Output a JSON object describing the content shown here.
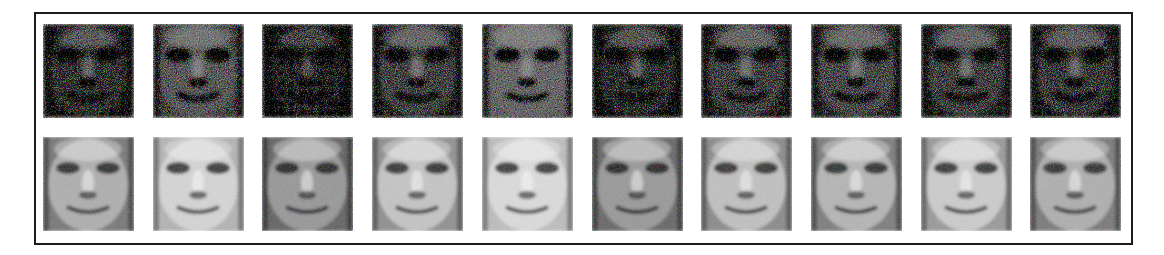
{
  "figure": {
    "frame": {
      "border_color": "#1c1c1c",
      "background": "#ffffff"
    },
    "rows": [
      {
        "label": "noisy",
        "description": "Noisy face images"
      },
      {
        "label": "reconstructed",
        "description": "Denoised / reconstructed face images"
      }
    ],
    "columns": 10,
    "faces": [
      {
        "index": 1,
        "noisy": {
          "tone": "#6e6e6e",
          "darkness": 0.55
        },
        "clean": {
          "tone": "#8a8a8a",
          "skin": "#bdbdbd",
          "features": "dark-eyes, dark lower-left"
        }
      },
      {
        "index": 2,
        "noisy": {
          "tone": "#8c8c8c",
          "darkness": 0.4
        },
        "clean": {
          "tone": "#bcbcbc",
          "skin": "#dcdcdc",
          "features": "bright face, smile"
        }
      },
      {
        "index": 3,
        "noisy": {
          "tone": "#5a5a5a",
          "darkness": 0.65
        },
        "clean": {
          "tone": "#7a7a7a",
          "skin": "#a8a8a8",
          "features": "dark, bright cheek"
        }
      },
      {
        "index": 4,
        "noisy": {
          "tone": "#7c7c7c",
          "darkness": 0.5
        },
        "clean": {
          "tone": "#9e9e9e",
          "skin": "#cfcfcf",
          "features": "smile, glasses"
        }
      },
      {
        "index": 5,
        "noisy": {
          "tone": "#9a9a9a",
          "darkness": 0.35
        },
        "clean": {
          "tone": "#c4c4c4",
          "skin": "#e2e2e2",
          "features": "pale, frown"
        }
      },
      {
        "index": 6,
        "noisy": {
          "tone": "#6a6a6a",
          "darkness": 0.6
        },
        "clean": {
          "tone": "#7e7e7e",
          "skin": "#aaaaaa",
          "features": "dark eyes, mustache"
        }
      },
      {
        "index": 7,
        "noisy": {
          "tone": "#7a7a7a",
          "darkness": 0.5
        },
        "clean": {
          "tone": "#9a9a9a",
          "skin": "#cccccc",
          "features": "smile"
        }
      },
      {
        "index": 8,
        "noisy": {
          "tone": "#828282",
          "darkness": 0.5
        },
        "clean": {
          "tone": "#8e8e8e",
          "skin": "#c2c2c2",
          "features": "glasses, mustache"
        }
      },
      {
        "index": 9,
        "noisy": {
          "tone": "#7a7a7a",
          "darkness": 0.5
        },
        "clean": {
          "tone": "#a6a6a6",
          "skin": "#d6d6d6",
          "features": "wide smile"
        }
      },
      {
        "index": 10,
        "noisy": {
          "tone": "#767676",
          "darkness": 0.55
        },
        "clean": {
          "tone": "#8c8c8c",
          "skin": "#bcbcbc",
          "features": "beard, dark right edge"
        }
      }
    ]
  }
}
